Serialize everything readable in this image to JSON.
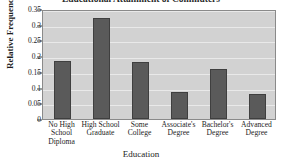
{
  "chart_data": {
    "type": "bar",
    "title": "Educational Attainment of Commuters",
    "xlabel": "Education",
    "ylabel": "Relative Frequency",
    "categories": [
      "No High School Diploma",
      "High School Graduate",
      "Some College",
      "Associate's Degree",
      "Bachelor's Degree",
      "Advanced Degree"
    ],
    "category_lines": [
      [
        "No High",
        "School",
        "Diploma"
      ],
      [
        "High School",
        "Graduate",
        ""
      ],
      [
        "Some",
        "College",
        ""
      ],
      [
        "Associate's",
        "Degree",
        ""
      ],
      [
        "Bachelor's",
        "Degree",
        ""
      ],
      [
        "Advanced",
        "Degree",
        ""
      ]
    ],
    "values": [
      0.185,
      0.32,
      0.18,
      0.085,
      0.16,
      0.08
    ],
    "ylim": [
      0,
      0.35
    ],
    "yticks": [
      0,
      0.05,
      0.1,
      0.15,
      0.2,
      0.25,
      0.3,
      0.35
    ],
    "ytick_labels": [
      "0",
      "0.05",
      "0.1",
      "0.15",
      "0.2",
      "0.25",
      "0.3",
      "0.35"
    ],
    "grid": true,
    "legend": false,
    "colors": {
      "bar_fill": "#5a5a5a",
      "bar_edge": "#3f3f3f",
      "plot_background": "#d2d2d2",
      "gridline": "#e9e9e9",
      "axis": "#8a8a8a",
      "figure_background": "#ffffff",
      "text": "#1d1d1d"
    }
  }
}
